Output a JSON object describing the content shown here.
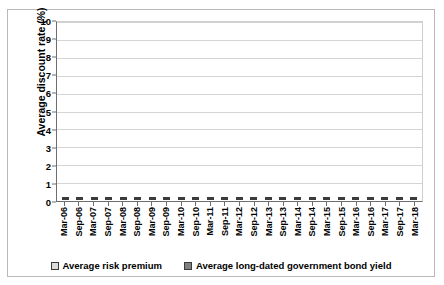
{
  "chart_data": {
    "type": "bar",
    "subtype": "stacked-column",
    "title": "",
    "xlabel": "",
    "ylabel": "Average discount rate (%)",
    "ylim": [
      0,
      10
    ],
    "ytick_step": 1,
    "yticks": [
      "0",
      "1",
      "2",
      "3",
      "4",
      "5",
      "6",
      "7",
      "8",
      "9",
      "10"
    ],
    "grid": true,
    "legend_position": "bottom",
    "categories": [
      "Mar-06",
      "Sep-06",
      "Mar-07",
      "Sep-07",
      "Mar-08",
      "Sep-08",
      "Mar-09",
      "Sep-09",
      "Mar-10",
      "Sep-10",
      "Mar-11",
      "Sep-11",
      "Mar-12",
      "Sep-12",
      "Mar-13",
      "Sep-13",
      "Mar-14",
      "Sep-14",
      "Mar-15",
      "Sep-15",
      "Mar-16",
      "Sep-16",
      "Mar-17",
      "Sep-17",
      "Mar-18"
    ],
    "series": [
      {
        "name": "Average risk premium",
        "color": "#dcdcdc",
        "values": [
          3.9,
          3.8,
          2.3,
          2.4,
          3.2,
          4.0,
          4.0,
          4.5,
          4.4,
          5.0,
          4.6,
          5.1,
          5.3,
          5.3,
          4.7,
          4.7,
          5.5,
          5.6,
          5.8,
          5.8,
          6.1,
          6.0,
          6.3,
          6.3,
          6.5
        ]
      },
      {
        "name": "Average long-dated government bond yield",
        "color": "#808080",
        "values": [
          4.1,
          4.1,
          4.7,
          4.9,
          4.2,
          3.9,
          4.0,
          4.0,
          4.3,
          3.7,
          4.1,
          3.6,
          3.2,
          3.0,
          3.5,
          3.4,
          2.7,
          2.4,
          2.0,
          1.9,
          1.4,
          1.4,
          1.0,
          1.0,
          0.9
        ]
      }
    ],
    "totals": [
      8.0,
      7.9,
      7.0,
      7.3,
      7.4,
      7.9,
      8.0,
      8.5,
      8.7,
      8.7,
      8.7,
      8.7,
      8.5,
      8.3,
      8.2,
      8.1,
      8.2,
      8.0,
      7.8,
      7.7,
      7.5,
      7.4,
      7.3,
      7.3,
      7.4
    ]
  },
  "legend": {
    "items": [
      {
        "label": "Average risk premium",
        "swatch": "premium"
      },
      {
        "label": "Average long-dated government bond yield",
        "swatch": "bond"
      }
    ]
  }
}
